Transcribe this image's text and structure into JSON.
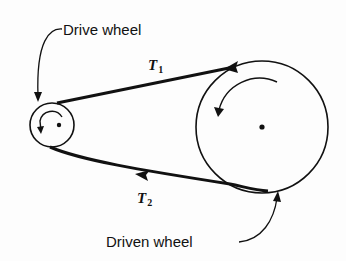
{
  "diagram": {
    "labels": {
      "drive_wheel": "Drive wheel",
      "driven_wheel": "Driven wheel",
      "tension_top": {
        "symbol": "T",
        "subscript": "1"
      },
      "tension_bottom": {
        "symbol": "T",
        "subscript": "2"
      }
    },
    "drive_wheel": {
      "cx": 52,
      "cy": 125,
      "r": 22,
      "rotation": "counterclockwise"
    },
    "driven_wheel": {
      "cx": 262,
      "cy": 127,
      "r": 66,
      "rotation": "counterclockwise"
    },
    "belt": {
      "top_span_direction": "toward drive wheel",
      "bottom_span_direction": "toward drive wheel"
    },
    "colors": {
      "ink": "#111111",
      "background": "#fdfdfd"
    }
  }
}
